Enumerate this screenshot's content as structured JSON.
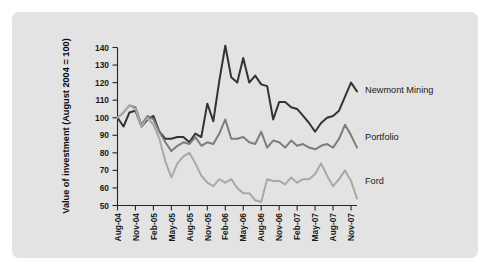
{
  "figure": {
    "background_color": "#ffffff",
    "panel_color": "#e3e3e3"
  },
  "chart_data": {
    "type": "line",
    "title": "",
    "xlabel": "",
    "ylabel": "Value of investment (August 2004 = 100)",
    "ylim": [
      50,
      140
    ],
    "yticks": [
      50,
      60,
      70,
      80,
      90,
      100,
      110,
      120,
      130,
      140
    ],
    "ytick_labels": [
      "50",
      "60",
      "70",
      "80",
      "90",
      "100",
      "110",
      "120",
      "130",
      "140"
    ],
    "grid": false,
    "legend_position": "right-inline",
    "x": [
      "Aug-04",
      "Sep-04",
      "Oct-04",
      "Nov-04",
      "Dec-04",
      "Jan-05",
      "Feb-05",
      "Mar-05",
      "Apr-05",
      "May-05",
      "Jun-05",
      "Jul-05",
      "Aug-05",
      "Sep-05",
      "Oct-05",
      "Nov-05",
      "Dec-05",
      "Jan-06",
      "Feb-06",
      "Mar-06",
      "Apr-06",
      "May-06",
      "Jun-06",
      "Jul-06",
      "Aug-06",
      "Sep-06",
      "Oct-06",
      "Nov-06",
      "Dec-06",
      "Jan-07",
      "Feb-07",
      "Mar-07",
      "Apr-07",
      "May-07",
      "Jun-07",
      "Jul-07",
      "Aug-07",
      "Sep-07",
      "Oct-07",
      "Nov-07",
      "Dec-07"
    ],
    "xtick_labels": [
      "Aug-04",
      "Nov-04",
      "Feb-05",
      "May-05",
      "Aug-05",
      "Nov-05",
      "Feb-06",
      "May-06",
      "Aug-06",
      "Nov-06",
      "Feb-07",
      "May-07",
      "Aug-07",
      "Nov-07"
    ],
    "xtick_indices": [
      0,
      3,
      6,
      9,
      12,
      15,
      18,
      21,
      24,
      27,
      30,
      33,
      36,
      39
    ],
    "series": [
      {
        "name": "Newmont Mining",
        "color": "#333333",
        "width": 2.0,
        "values": [
          100,
          95,
          103,
          104,
          95,
          99,
          101,
          92,
          88,
          88,
          89,
          89,
          86,
          91,
          89,
          108,
          98,
          121,
          141,
          123,
          120,
          134,
          120,
          124,
          119,
          118,
          99,
          109,
          109,
          106,
          105,
          101,
          97,
          92,
          97,
          100,
          101,
          104,
          112,
          120,
          115
        ]
      },
      {
        "name": "Portfolio",
        "color": "#7d7d7d",
        "width": 2.0,
        "values": [
          100,
          103,
          107,
          106,
          96,
          101,
          99,
          92,
          86,
          81,
          84,
          86,
          85,
          89,
          84,
          86,
          85,
          91,
          99,
          88,
          88,
          89,
          86,
          85,
          92,
          83,
          87,
          86,
          83,
          87,
          84,
          85,
          83,
          82,
          84,
          85,
          83,
          88,
          96,
          90,
          83
        ]
      },
      {
        "name": "Ford",
        "color": "#a8a8a8",
        "width": 2.0,
        "values": [
          100,
          103,
          107,
          105,
          95,
          100,
          96,
          88,
          75,
          66,
          74,
          78,
          80,
          74,
          67,
          63,
          61,
          65,
          63,
          65,
          60,
          57,
          57,
          53,
          52,
          65,
          64,
          64,
          62,
          66,
          63,
          65,
          65,
          68,
          74,
          67,
          61,
          65,
          70,
          64,
          54
        ]
      }
    ]
  }
}
